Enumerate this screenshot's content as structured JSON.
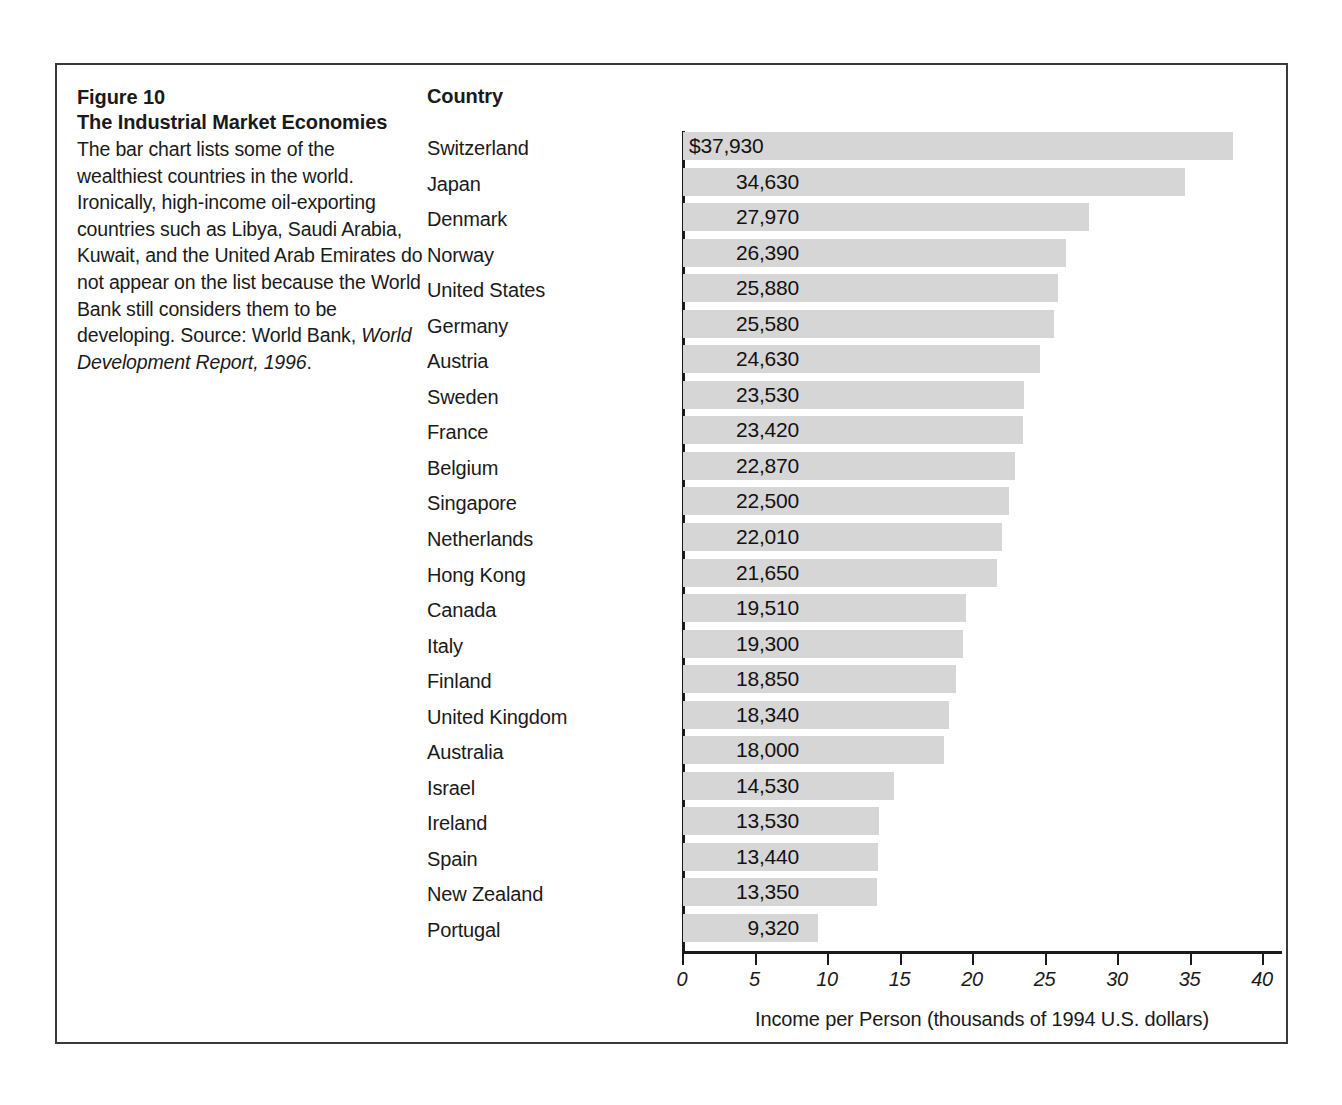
{
  "figure": {
    "number": "Figure 10",
    "title": "The Industrial Market Economies",
    "caption_plain": "The bar chart lists some of the wealthiest countries in the world. Ironically, high-income oil-exporting countries such as Libya, Saudi Arabia, Kuwait, and the United Arab Emirates do not appear on the list because the World Bank still considers them to be developing. Source: World Bank, ",
    "caption_italic": "World Development Report, 1996",
    "caption_tail": "."
  },
  "table": {
    "country_header": "Country"
  },
  "chart_data": {
    "type": "bar",
    "orientation": "horizontal",
    "title": "The Industrial Market Economies",
    "xlabel": "Income per Person (thousands of 1994 U.S. dollars)",
    "ylabel": "Country",
    "xlim": [
      0,
      40
    ],
    "grid": false,
    "legend": null,
    "xticks": [
      0,
      5,
      10,
      15,
      20,
      25,
      30,
      35,
      40
    ],
    "xtick_labels": [
      "0",
      "5",
      "10",
      "15",
      "20",
      "25",
      "30",
      "35",
      "40"
    ],
    "units": "thousands of 1994 U.S. dollars",
    "bar_color": "#d6d6d6",
    "axis_color": "#1a1a1a",
    "categories": [
      "Switzerland",
      "Japan",
      "Denmark",
      "Norway",
      "United States",
      "Germany",
      "Austria",
      "Sweden",
      "France",
      "Belgium",
      "Singapore",
      "Netherlands",
      "Hong Kong",
      "Canada",
      "Italy",
      "Finland",
      "United Kingdom",
      "Australia",
      "Israel",
      "Ireland",
      "Spain",
      "New Zealand",
      "Portugal"
    ],
    "values": [
      37930,
      34630,
      27970,
      26390,
      25880,
      25580,
      24630,
      23530,
      23420,
      22870,
      22500,
      22010,
      21650,
      19510,
      19300,
      18850,
      18340,
      18000,
      14530,
      13530,
      13440,
      13350,
      9320
    ],
    "value_labels": [
      "$37,930",
      "34,630",
      "27,970",
      "26,390",
      "25,880",
      "25,580",
      "24,630",
      "23,530",
      "23,420",
      "22,870",
      "22,500",
      "22,010",
      "21,650",
      "19,510",
      "19,300",
      "18,850",
      "18,340",
      "18,000",
      "14,530",
      "13,530",
      "13,440",
      "13,350",
      "9,320"
    ]
  }
}
